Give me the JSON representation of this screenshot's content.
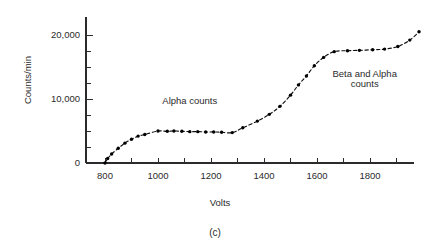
{
  "figure": {
    "caption": "(c)",
    "background_color": "#ffffff",
    "ink_color": "#1a1a1a"
  },
  "chart_data": {
    "type": "line",
    "title": "",
    "subtitle": "",
    "xlabel": "Volts",
    "ylabel": "Counts/min",
    "xlim": [
      700,
      2000
    ],
    "ylim": [
      0,
      22500
    ],
    "grid": false,
    "legend": "none",
    "marker": "filled-circle",
    "linestyle": "dashed",
    "x_major_ticks": [
      800,
      1000,
      1200,
      1400,
      1600,
      1800
    ],
    "x_tick_labels": [
      "800",
      "1000",
      "1200",
      "1400",
      "1600",
      "1800"
    ],
    "x_minor_ticks": [
      700,
      900,
      1100,
      1300,
      1500,
      1700,
      1900
    ],
    "y_major_ticks": [
      0,
      10000,
      20000
    ],
    "y_tick_labels": [
      "0",
      "10,000",
      "20,000"
    ],
    "y_minor_ticks": [
      2500,
      5000,
      7500,
      12500,
      15000,
      17500
    ],
    "x": [
      800,
      810,
      825,
      850,
      875,
      900,
      925,
      950,
      1000,
      1035,
      1060,
      1090,
      1120,
      1150,
      1180,
      1210,
      1240,
      1280,
      1320,
      1375,
      1420,
      1460,
      1500,
      1530,
      1560,
      1590,
      1625,
      1665,
      1715,
      1760,
      1810,
      1855,
      1905,
      1950,
      1985
    ],
    "y": [
      0,
      700,
      1400,
      2300,
      3100,
      3700,
      4200,
      4450,
      5000,
      4950,
      5000,
      4950,
      4900,
      4900,
      4850,
      4850,
      4800,
      4750,
      5500,
      6550,
      7600,
      8850,
      10600,
      12200,
      13600,
      15200,
      16500,
      17400,
      17550,
      17600,
      17700,
      17800,
      18200,
      19200,
      20500
    ],
    "annotations": [
      {
        "text": "Alpha counts",
        "x": 1120,
        "y": 9200,
        "align": "middle"
      },
      {
        "text": "Beta and Alpha",
        "x": 1780,
        "y": 13400,
        "align": "middle"
      },
      {
        "text": "counts",
        "x": 1780,
        "y": 11800,
        "align": "middle"
      }
    ]
  }
}
